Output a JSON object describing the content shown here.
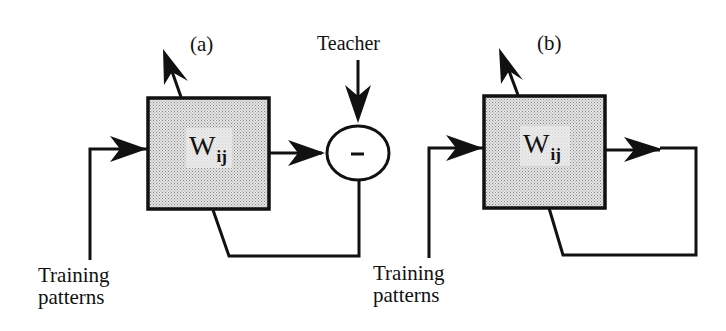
{
  "figure": {
    "panel_a": {
      "label": "(a)",
      "weight_matrix": {
        "symbol": "W",
        "subscript": "ij"
      },
      "teacher_label": "Teacher",
      "comparator_symbol": "–",
      "input_label_line1": "Training",
      "input_label_line2": "patterns"
    },
    "panel_b": {
      "label": "(b)",
      "weight_matrix": {
        "symbol": "W",
        "subscript": "ij"
      },
      "input_label_line1": "Training",
      "input_label_line2": "patterns"
    },
    "colors": {
      "stroke": "#111111",
      "box_fill": "#d6d6d6",
      "background": "#ffffff"
    }
  }
}
